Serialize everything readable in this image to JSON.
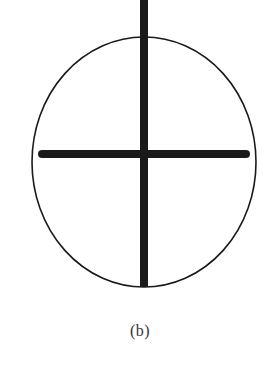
{
  "figure": {
    "caption": "(b)",
    "colors": {
      "background": "#ffffff",
      "stroke": "#1a1a1a",
      "caption": "#333333"
    },
    "ellipse": {
      "cx": 144,
      "cy": 162,
      "rx": 112,
      "ry": 125,
      "stroke_width": 1.6
    },
    "vertical_bar": {
      "x": 144,
      "y1": 0,
      "y2": 287,
      "width": 8
    },
    "horizontal_bar": {
      "x1": 42,
      "x2": 246,
      "y": 154,
      "width": 8
    }
  }
}
